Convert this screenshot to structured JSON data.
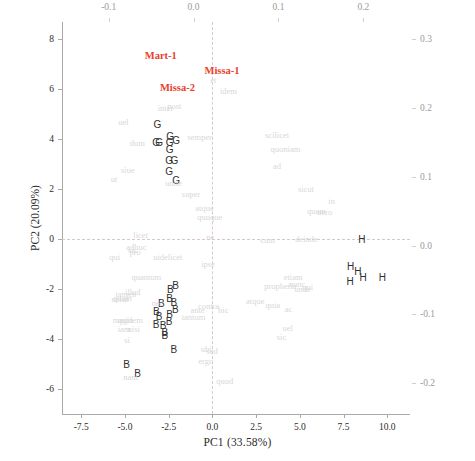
{
  "chart_data": {
    "type": "scatter",
    "title": "",
    "xlabel": "PC1 (33.58%)",
    "ylabel": "PC2 (20.09%)",
    "xlim": [
      -8.6,
      11.3
    ],
    "ylim": [
      -7.0,
      8.7
    ],
    "x_ticks": [
      "-7.5",
      "-5.0",
      "-2.5",
      "0.0",
      "2.5",
      "5.0",
      "7.5",
      "10.0"
    ],
    "x_tick_values": [
      -7.5,
      -5.0,
      -2.5,
      0.0,
      2.5,
      5.0,
      7.5,
      10.0
    ],
    "y_ticks": [
      "8",
      "6",
      "4",
      "2",
      "0",
      "-2",
      "-4",
      "-6"
    ],
    "y_tick_values": [
      8,
      6,
      4,
      2,
      0,
      -2,
      -4,
      -6
    ],
    "secondary_x_label": "",
    "secondary_x_ticks": [
      "-0.1",
      "0.0",
      "0.1",
      "0.2"
    ],
    "secondary_x_tick_values": [
      -0.1,
      0.0,
      0.1,
      0.2
    ],
    "secondary_y_label": "",
    "secondary_y_ticks": [
      "0.3",
      "0.2",
      "0.1",
      "0.0",
      "-0.1",
      "-0.2"
    ],
    "secondary_y_tick_values": [
      0.3,
      0.2,
      0.1,
      0.0,
      -0.1,
      -0.2
    ],
    "grid": false,
    "reference_lines": {
      "vertical_x": 0.0,
      "horizontal_y": 0.0
    },
    "legend_position": "none",
    "colors": {
      "group_label": "#e8412c",
      "point_letter": "#2f2f2f",
      "loading_word": "#d7d7d9",
      "axis": "#a9a9a9",
      "refline": "#d8c9c9"
    },
    "series": [
      {
        "name": "group-labels",
        "kind": "text-label",
        "color": "#e8412c",
        "points": [
          {
            "label": "Mart-1",
            "x": -2.95,
            "y": 7.35
          },
          {
            "label": "Missa-1",
            "x": 0.55,
            "y": 6.72
          },
          {
            "label": "Missa-2",
            "x": -2.0,
            "y": 6.05
          }
        ]
      },
      {
        "name": "G-samples",
        "kind": "scatter-letter",
        "color": "#2f2f2f",
        "letter": "G",
        "points": [
          {
            "label": "G",
            "x": -3.15,
            "y": 4.58
          },
          {
            "label": "G",
            "x": -2.42,
            "y": 4.1
          },
          {
            "label": "G",
            "x": -3.22,
            "y": 3.86
          },
          {
            "label": "G",
            "x": -3.05,
            "y": 3.86
          },
          {
            "label": "G",
            "x": -2.45,
            "y": 3.86
          },
          {
            "label": "G",
            "x": -2.08,
            "y": 3.92
          },
          {
            "label": "G",
            "x": -2.45,
            "y": 3.56
          },
          {
            "label": "G",
            "x": -2.47,
            "y": 3.12
          },
          {
            "label": "G",
            "x": -2.18,
            "y": 3.12
          },
          {
            "label": "G",
            "x": -2.47,
            "y": 2.7
          },
          {
            "label": "G",
            "x": -2.08,
            "y": 2.32
          }
        ]
      },
      {
        "name": "B-samples",
        "kind": "scatter-letter",
        "color": "#2f2f2f",
        "letter": "B",
        "points": [
          {
            "label": "B",
            "x": -2.4,
            "y": -2.02
          },
          {
            "label": "B",
            "x": -2.1,
            "y": -1.88
          },
          {
            "label": "B",
            "x": -2.45,
            "y": -2.38
          },
          {
            "label": "B",
            "x": -2.92,
            "y": -2.58
          },
          {
            "label": "B",
            "x": -2.2,
            "y": -2.55
          },
          {
            "label": "B",
            "x": -2.12,
            "y": -2.82
          },
          {
            "label": "B",
            "x": -3.2,
            "y": -2.92
          },
          {
            "label": "B",
            "x": -3.05,
            "y": -3.1
          },
          {
            "label": "B",
            "x": -2.45,
            "y": -3.05
          },
          {
            "label": "B",
            "x": -2.48,
            "y": -3.3
          },
          {
            "label": "B",
            "x": -3.22,
            "y": -3.42
          },
          {
            "label": "B",
            "x": -2.82,
            "y": -3.48
          },
          {
            "label": "B",
            "x": -2.72,
            "y": -3.75
          },
          {
            "label": "B",
            "x": -2.72,
            "y": -3.88
          },
          {
            "label": "B",
            "x": -2.2,
            "y": -4.45
          },
          {
            "label": "B",
            "x": -4.9,
            "y": -5.05
          },
          {
            "label": "B",
            "x": -4.28,
            "y": -5.38
          }
        ]
      },
      {
        "name": "H-samples",
        "kind": "scatter-letter",
        "color": "#2f2f2f",
        "letter": "H",
        "points": [
          {
            "label": "H",
            "x": 8.55,
            "y": -0.05
          },
          {
            "label": "H",
            "x": 7.9,
            "y": -1.12
          },
          {
            "label": "H",
            "x": 8.32,
            "y": -1.32
          },
          {
            "label": "H",
            "x": 8.62,
            "y": -1.55
          },
          {
            "label": "H",
            "x": 7.88,
            "y": -1.72
          },
          {
            "label": "H",
            "x": 9.72,
            "y": -1.55
          }
        ]
      },
      {
        "name": "loadings-words",
        "kind": "text-loading",
        "color": "#d7d7d9",
        "points": [
          {
            "label": "et",
            "x": 0.05,
            "y": 6.38
          },
          {
            "label": "idem",
            "x": 0.92,
            "y": 5.92
          },
          {
            "label": "inter",
            "x": -2.68,
            "y": 5.25
          },
          {
            "label": "post",
            "x": -2.18,
            "y": 5.35
          },
          {
            "label": "uel",
            "x": -5.08,
            "y": 4.68
          },
          {
            "label": "semper",
            "x": -0.72,
            "y": 4.08
          },
          {
            "label": "scilicet",
            "x": 3.7,
            "y": 4.18
          },
          {
            "label": "dum",
            "x": -4.3,
            "y": 3.85
          },
          {
            "label": "quoniam",
            "x": 4.18,
            "y": 3.62
          },
          {
            "label": "ad",
            "x": 3.7,
            "y": 2.92
          },
          {
            "label": "siue",
            "x": -4.85,
            "y": 2.78
          },
          {
            "label": "ut",
            "x": -5.62,
            "y": 2.4
          },
          {
            "label": "unde",
            "x": -2.22,
            "y": 2.25
          },
          {
            "label": "sicut",
            "x": 5.35,
            "y": 2.0
          },
          {
            "label": "super",
            "x": -1.22,
            "y": 1.82
          },
          {
            "label": "in",
            "x": 6.82,
            "y": 1.55
          },
          {
            "label": "atque",
            "x": -0.45,
            "y": 1.25
          },
          {
            "label": "quam",
            "x": 5.95,
            "y": 1.12
          },
          {
            "label": "uero",
            "x": 6.42,
            "y": 1.08
          },
          {
            "label": "quoque",
            "x": -0.15,
            "y": 0.88
          },
          {
            "label": "licet",
            "x": -4.1,
            "y": 0.18
          },
          {
            "label": "ne",
            "x": -0.12,
            "y": 0.1
          },
          {
            "label": "cum",
            "x": 3.15,
            "y": -0.02
          },
          {
            "label": "deinde",
            "x": 5.38,
            "y": 0.02
          },
          {
            "label": "adhuc",
            "x": -4.35,
            "y": -0.3
          },
          {
            "label": "sic",
            "x": -4.55,
            "y": -0.42
          },
          {
            "label": "pro",
            "x": -4.42,
            "y": -0.52
          },
          {
            "label": "qui",
            "x": -5.58,
            "y": -0.72
          },
          {
            "label": "uidelicet",
            "x": -2.55,
            "y": -0.72
          },
          {
            "label": "ipse",
            "x": -0.25,
            "y": -0.98
          },
          {
            "label": "etiam",
            "x": 4.62,
            "y": -1.52
          },
          {
            "label": "quantum",
            "x": -3.78,
            "y": -1.52
          },
          {
            "label": "prophetia",
            "x": 3.88,
            "y": -1.88
          },
          {
            "label": "nunc",
            "x": 4.85,
            "y": -1.8
          },
          {
            "label": "unde",
            "x": 5.15,
            "y": -2.0
          },
          {
            "label": "qui",
            "x": 5.45,
            "y": -1.92
          },
          {
            "label": "tamen",
            "x": -4.95,
            "y": -2.18
          },
          {
            "label": "illud",
            "x": -4.55,
            "y": -2.12
          },
          {
            "label": "quam",
            "x": -5.15,
            "y": -2.35
          },
          {
            "label": "uelut",
            "x": -5.28,
            "y": -2.38
          },
          {
            "label": "nec",
            "x": -3.15,
            "y": -2.55
          },
          {
            "label": "contra",
            "x": -0.22,
            "y": -2.68
          },
          {
            "label": "ante",
            "x": -0.85,
            "y": -2.85
          },
          {
            "label": "hic",
            "x": 0.62,
            "y": -2.82
          },
          {
            "label": "atque",
            "x": 2.45,
            "y": -2.48
          },
          {
            "label": "quia",
            "x": 3.45,
            "y": -2.65
          },
          {
            "label": "ac",
            "x": 4.35,
            "y": -2.78
          },
          {
            "label": "magis",
            "x": -5.12,
            "y": -3.25
          },
          {
            "label": "quidem",
            "x": -4.7,
            "y": -3.25
          },
          {
            "label": "iam",
            "x": -5.05,
            "y": -3.58
          },
          {
            "label": "nisi",
            "x": -4.5,
            "y": -3.58
          },
          {
            "label": "tantum",
            "x": -1.08,
            "y": -3.12
          },
          {
            "label": "si",
            "x": -4.88,
            "y": -4.02
          },
          {
            "label": "uel",
            "x": 4.3,
            "y": -3.55
          },
          {
            "label": "sic",
            "x": 3.95,
            "y": -3.92
          },
          {
            "label": "ubi",
            "x": -0.35,
            "y": -4.38
          },
          {
            "label": "sed",
            "x": -0.02,
            "y": -4.48
          },
          {
            "label": "ergo",
            "x": -0.38,
            "y": -4.88
          },
          {
            "label": "nam",
            "x": -4.68,
            "y": -5.5
          },
          {
            "label": "quod",
            "x": 0.7,
            "y": -5.68
          }
        ]
      }
    ]
  },
  "axes": {
    "x_title": "PC1 (33.58%)",
    "y_title": "PC2 (20.09%)"
  }
}
